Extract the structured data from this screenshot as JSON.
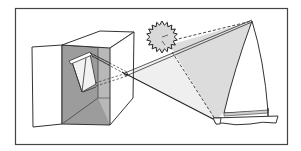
{
  "diagram": {
    "elements": [
      {
        "name": "frame",
        "label": ""
      },
      {
        "name": "box",
        "label": ""
      },
      {
        "name": "open-door",
        "label": ""
      },
      {
        "name": "pinhole",
        "label": ""
      },
      {
        "name": "inverted-image",
        "label": ""
      },
      {
        "name": "sun",
        "label": ""
      },
      {
        "name": "sailboat",
        "label": ""
      },
      {
        "name": "light-rays",
        "label": ""
      }
    ],
    "text_labels": []
  },
  "colors": {
    "background": "#ffffff",
    "stroke": "#333333",
    "box_interior": "#9a9a9a",
    "box_inner_side": "#b5b5b5",
    "light_cone": "#dedede",
    "image_panel": "#f4f4f4",
    "sun_fill": "#d6d6d6"
  }
}
